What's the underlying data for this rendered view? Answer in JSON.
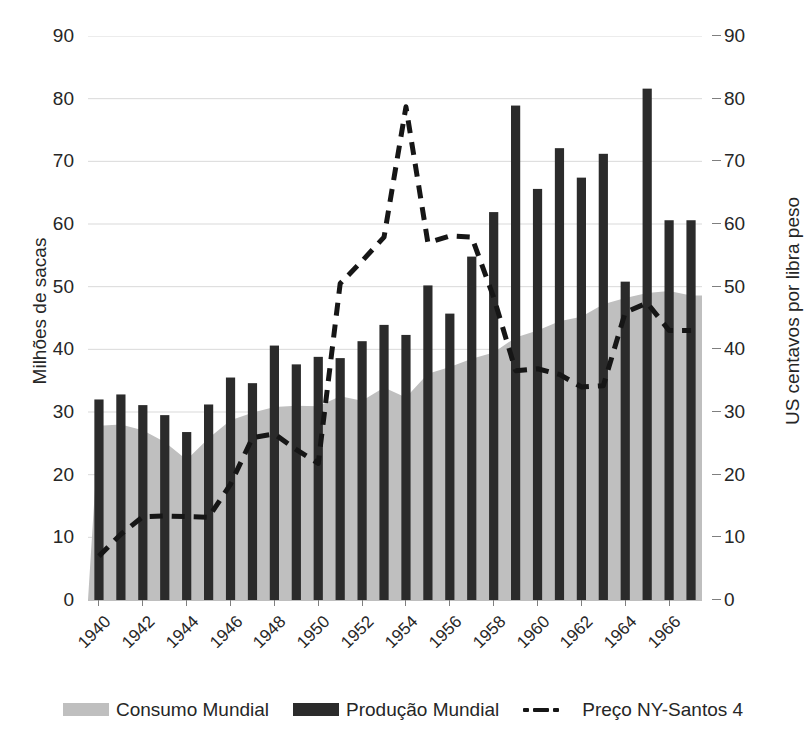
{
  "axes": {
    "y_left_title": "Milhões de sacas",
    "y_right_title": "US centavos por libra peso",
    "y_ticks": [
      "0",
      "10",
      "20",
      "30",
      "40",
      "50",
      "60",
      "70",
      "80",
      "90"
    ],
    "x_ticks": [
      "1940",
      "1942",
      "1944",
      "1946",
      "1948",
      "1950",
      "1952",
      "1954",
      "1956",
      "1958",
      "1960",
      "1962",
      "1964",
      "1966"
    ]
  },
  "legend": {
    "items": [
      {
        "label": "Consumo Mundial",
        "marker": "area-swatch",
        "color": "#bfbfbf"
      },
      {
        "label": "Produção Mundial",
        "marker": "bar-swatch",
        "color": "#2b2b2b"
      },
      {
        "label": "Preço NY-Santos 4",
        "marker": "dashed-line-swatch",
        "color": "#161616"
      }
    ]
  },
  "colors": {
    "bars": "#2b2b2b",
    "area": "#bfbfbf",
    "line": "#161616",
    "gridline": "#d9d9d9",
    "axis": "#7f7f7f",
    "text": "#262626"
  },
  "chart_data": {
    "type": "bar",
    "title": "",
    "xlabel": "",
    "ylabel": "Milhões de sacas",
    "y2label": "US centavos por libra peso",
    "ylim": [
      0,
      90
    ],
    "y2lim": [
      0,
      90
    ],
    "grid": true,
    "legend_position": "bottom",
    "categories": [
      "1940",
      "1941",
      "1942",
      "1943",
      "1944",
      "1945",
      "1946",
      "1947",
      "1948",
      "1949",
      "1950",
      "1951",
      "1952",
      "1953",
      "1954",
      "1955",
      "1956",
      "1957",
      "1958",
      "1959",
      "1960",
      "1961",
      "1962",
      "1963",
      "1964",
      "1965",
      "1966",
      "1967"
    ],
    "series": [
      {
        "name": "Produção Mundial",
        "type": "bar",
        "axis": "left",
        "unit": "Milhões de sacas",
        "values": [
          32.0,
          32.8,
          31.1,
          29.5,
          26.8,
          31.2,
          35.5,
          34.6,
          40.6,
          37.6,
          38.8,
          38.6,
          41.3,
          43.9,
          42.3,
          50.2,
          45.7,
          54.8,
          61.9,
          78.9,
          65.6,
          72.1,
          67.4,
          71.2,
          50.8,
          81.6,
          60.6,
          60.6
        ]
      },
      {
        "name": "Consumo Mundial",
        "type": "area",
        "axis": "left",
        "unit": "Milhões de sacas",
        "values": [
          27.8,
          28.0,
          27.1,
          25.2,
          22.4,
          25.8,
          28.7,
          29.9,
          30.8,
          31.0,
          30.9,
          32.5,
          31.8,
          33.9,
          32.3,
          36.1,
          37.2,
          38.5,
          39.5,
          41.9,
          43.0,
          44.5,
          45.2,
          47.2,
          48.2,
          49.0,
          49.3,
          48.6
        ]
      },
      {
        "name": "Preço NY-Santos 4",
        "type": "line",
        "style": "dashed",
        "axis": "right",
        "unit": "US centavos por libra peso",
        "values": [
          7.0,
          10.5,
          13.3,
          13.4,
          13.3,
          13.2,
          18.5,
          25.9,
          26.5,
          24.0,
          21.8,
          50.5,
          54.1,
          57.9,
          78.7,
          57.0,
          58.1,
          57.9,
          48.3,
          36.6,
          36.9,
          36.0,
          34.0,
          34.2,
          45.9,
          47.4,
          43.0,
          43.0
        ]
      }
    ]
  }
}
